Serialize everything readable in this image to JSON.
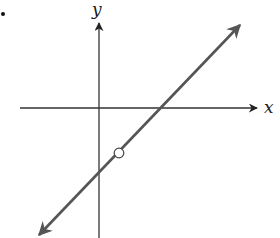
{
  "figure": {
    "bullet": "•",
    "axes": {
      "x_label": "x",
      "y_label": "y"
    },
    "line": {
      "description": "Line with positive slope, arrows at both ends, hole (open circle) below the x-axis",
      "color": "#555555"
    },
    "open_point": {
      "description": "open circle (excluded point)"
    }
  },
  "colors": {
    "axes": "#333333",
    "line": "#555555",
    "background": "#ffffff"
  }
}
